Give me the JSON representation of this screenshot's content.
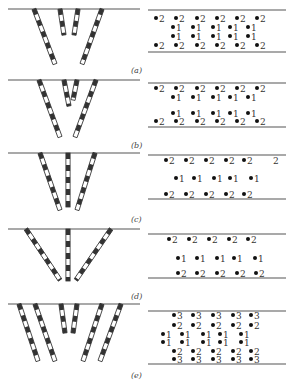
{
  "figure": {
    "panels": [
      {
        "id": "a",
        "caption": "(a)",
        "side_view": {
          "ground_y": 9,
          "bars": [
            {
              "x1": 34,
              "y1": 9,
              "x2": 55,
              "y2": 64
            },
            {
              "x1": 60,
              "y1": 9,
              "x2": 64,
              "y2": 35
            },
            {
              "x1": 78,
              "y1": 9,
              "x2": 74,
              "y2": 35
            },
            {
              "x1": 102,
              "y1": 9,
              "x2": 82,
              "y2": 64
            }
          ]
        },
        "plan_view": {
          "top_line_y": 10,
          "bottom_line_y": 52,
          "rows": [
            {
              "y": 18,
              "holes": [
                {
                  "x": 156,
                  "n": "2"
                },
                {
                  "x": 176,
                  "n": "2"
                },
                {
                  "x": 197,
                  "n": "2"
                },
                {
                  "x": 217,
                  "n": "2"
                },
                {
                  "x": 237,
                  "n": "2"
                },
                {
                  "x": 257,
                  "n": "2"
                }
              ]
            },
            {
              "y": 27,
              "holes": [
                {
                  "x": 173,
                  "n": "1"
                },
                {
                  "x": 193,
                  "n": "1"
                },
                {
                  "x": 213,
                  "n": "1"
                },
                {
                  "x": 230,
                  "n": "1"
                },
                {
                  "x": 248,
                  "n": "1"
                }
              ]
            },
            {
              "y": 36,
              "holes": [
                {
                  "x": 173,
                  "n": "1"
                },
                {
                  "x": 193,
                  "n": "1"
                },
                {
                  "x": 213,
                  "n": "1"
                },
                {
                  "x": 230,
                  "n": "1"
                },
                {
                  "x": 248,
                  "n": "1"
                }
              ]
            },
            {
              "y": 45,
              "holes": [
                {
                  "x": 156,
                  "n": "2"
                },
                {
                  "x": 176,
                  "n": "2"
                },
                {
                  "x": 197,
                  "n": "2"
                },
                {
                  "x": 217,
                  "n": "2"
                },
                {
                  "x": 237,
                  "n": "2"
                },
                {
                  "x": 257,
                  "n": "2"
                }
              ]
            }
          ]
        },
        "caption_pos": {
          "x": 131,
          "y": 66
        }
      },
      {
        "id": "b",
        "caption": "(b)",
        "side_view": {
          "ground_y": 80,
          "bars": [
            {
              "x1": 39,
              "y1": 80,
              "x2": 60,
              "y2": 137
            },
            {
              "x1": 64,
              "y1": 80,
              "x2": 69,
              "y2": 106
            },
            {
              "x1": 77,
              "y1": 80,
              "x2": 73,
              "y2": 100
            },
            {
              "x1": 96,
              "y1": 80,
              "x2": 75,
              "y2": 137
            }
          ]
        },
        "plan_view": {
          "top_line_y": 83,
          "bottom_line_y": 127,
          "rows": [
            {
              "y": 88,
              "holes": [
                {
                  "x": 156,
                  "n": "2"
                },
                {
                  "x": 176,
                  "n": "2"
                },
                {
                  "x": 197,
                  "n": "2"
                },
                {
                  "x": 217,
                  "n": "2"
                },
                {
                  "x": 237,
                  "n": "2"
                },
                {
                  "x": 257,
                  "n": "2"
                }
              ]
            },
            {
              "y": 97,
              "holes": [
                {
                  "x": 173,
                  "n": "1"
                },
                {
                  "x": 193,
                  "n": "1"
                },
                {
                  "x": 213,
                  "n": "1"
                },
                {
                  "x": 230,
                  "n": "1"
                },
                {
                  "x": 248,
                  "n": "1"
                }
              ]
            },
            {
              "y": 113,
              "holes": [
                {
                  "x": 173,
                  "n": "1"
                },
                {
                  "x": 193,
                  "n": "1"
                },
                {
                  "x": 213,
                  "n": "1"
                },
                {
                  "x": 230,
                  "n": "1"
                },
                {
                  "x": 248,
                  "n": "1"
                }
              ]
            },
            {
              "y": 121,
              "holes": [
                {
                  "x": 156,
                  "n": "2"
                },
                {
                  "x": 176,
                  "n": "2"
                },
                {
                  "x": 197,
                  "n": "2"
                },
                {
                  "x": 217,
                  "n": "2"
                },
                {
                  "x": 237,
                  "n": "2"
                },
                {
                  "x": 257,
                  "n": "2"
                }
              ]
            }
          ]
        },
        "caption_pos": {
          "x": 131,
          "y": 141
        }
      },
      {
        "id": "c",
        "caption": "(c)",
        "side_view": {
          "ground_y": 153,
          "bars": [
            {
              "x1": 40,
              "y1": 153,
              "x2": 60,
              "y2": 210
            },
            {
              "x1": 68,
              "y1": 153,
              "x2": 68,
              "y2": 207
            },
            {
              "x1": 95,
              "y1": 153,
              "x2": 77,
              "y2": 210
            }
          ]
        },
        "plan_view": {
          "top_line_y": 155,
          "bottom_line_y": 199,
          "rows": [
            {
              "y": 160,
              "holes": [
                {
                  "x": 166,
                  "n": "2"
                },
                {
                  "x": 186,
                  "n": "2"
                },
                {
                  "x": 206,
                  "n": "2"
                },
                {
                  "x": 226,
                  "n": "2"
                },
                {
                  "x": 244,
                  "n": "2"
                },
                {
                  "x": 270,
                  "n": "2",
                  "no_dot": true
                }
              ]
            },
            {
              "y": 178,
              "holes": [
                {
                  "x": 176,
                  "n": "1"
                },
                {
                  "x": 194,
                  "n": "1"
                },
                {
                  "x": 214,
                  "n": "1"
                },
                {
                  "x": 230,
                  "n": "1"
                },
                {
                  "x": 251,
                  "n": "1"
                }
              ]
            },
            {
              "y": 194,
              "holes": [
                {
                  "x": 166,
                  "n": "2"
                },
                {
                  "x": 186,
                  "n": "2"
                },
                {
                  "x": 206,
                  "n": "2"
                },
                {
                  "x": 226,
                  "n": "2"
                },
                {
                  "x": 244,
                  "n": "2"
                }
              ]
            }
          ]
        },
        "caption_pos": {
          "x": 131,
          "y": 215
        }
      },
      {
        "id": "d",
        "caption": "(d)",
        "side_view": {
          "ground_y": 229,
          "bars": [
            {
              "x1": 26,
              "y1": 229,
              "x2": 60,
              "y2": 280
            },
            {
              "x1": 68,
              "y1": 229,
              "x2": 68,
              "y2": 281
            },
            {
              "x1": 111,
              "y1": 229,
              "x2": 76,
              "y2": 280
            }
          ]
        },
        "plan_view": {
          "top_line_y": 234,
          "bottom_line_y": 278,
          "rows": [
            {
              "y": 239,
              "holes": [
                {
                  "x": 169,
                  "n": "2"
                },
                {
                  "x": 189,
                  "n": "2"
                },
                {
                  "x": 209,
                  "n": "2"
                },
                {
                  "x": 229,
                  "n": "2"
                },
                {
                  "x": 248,
                  "n": "2"
                }
              ]
            },
            {
              "y": 258,
              "holes": [
                {
                  "x": 178,
                  "n": "1"
                },
                {
                  "x": 197,
                  "n": "1"
                },
                {
                  "x": 217,
                  "n": "1"
                },
                {
                  "x": 234,
                  "n": "1"
                },
                {
                  "x": 255,
                  "n": "1"
                }
              ]
            },
            {
              "y": 273,
              "holes": [
                {
                  "x": 178,
                  "n": "2"
                },
                {
                  "x": 197,
                  "n": "2"
                },
                {
                  "x": 217,
                  "n": "2"
                },
                {
                  "x": 237,
                  "n": "2"
                },
                {
                  "x": 256,
                  "n": "2"
                }
              ]
            }
          ]
        },
        "caption_pos": {
          "x": 131,
          "y": 292
        }
      },
      {
        "id": "e",
        "caption": "(e)",
        "side_view": {
          "ground_y": 304,
          "bars": [
            {
              "x1": 19,
              "y1": 304,
              "x2": 38,
              "y2": 361
            },
            {
              "x1": 35,
              "y1": 304,
              "x2": 55,
              "y2": 361
            },
            {
              "x1": 61,
              "y1": 304,
              "x2": 65,
              "y2": 333
            },
            {
              "x1": 77,
              "y1": 304,
              "x2": 73,
              "y2": 333
            },
            {
              "x1": 102,
              "y1": 304,
              "x2": 83,
              "y2": 361
            },
            {
              "x1": 121,
              "y1": 304,
              "x2": 100,
              "y2": 361
            }
          ]
        },
        "plan_view": {
          "top_line_y": 311,
          "bottom_line_y": 364,
          "rows": [
            {
              "y": 315,
              "holes": [
                {
                  "x": 174,
                  "n": "3"
                },
                {
                  "x": 193,
                  "n": "3"
                },
                {
                  "x": 213,
                  "n": "3"
                },
                {
                  "x": 233,
                  "n": "3"
                },
                {
                  "x": 251,
                  "n": "3"
                }
              ]
            },
            {
              "y": 325,
              "holes": [
                {
                  "x": 174,
                  "n": "2"
                },
                {
                  "x": 193,
                  "n": "2"
                },
                {
                  "x": 213,
                  "n": "2"
                },
                {
                  "x": 233,
                  "n": "2"
                },
                {
                  "x": 251,
                  "n": "2"
                }
              ]
            },
            {
              "y": 334,
              "holes": [
                {
                  "x": 163,
                  "n": "1"
                },
                {
                  "x": 182,
                  "n": "1"
                },
                {
                  "x": 203,
                  "n": "1"
                },
                {
                  "x": 220,
                  "n": "1"
                },
                {
                  "x": 241,
                  "n": "1"
                }
              ]
            },
            {
              "y": 342,
              "holes": [
                {
                  "x": 163,
                  "n": "1"
                },
                {
                  "x": 182,
                  "n": "1"
                },
                {
                  "x": 203,
                  "n": "1"
                },
                {
                  "x": 220,
                  "n": "1"
                },
                {
                  "x": 241,
                  "n": "1"
                }
              ]
            },
            {
              "y": 351,
              "holes": [
                {
                  "x": 174,
                  "n": "2"
                },
                {
                  "x": 193,
                  "n": "2"
                },
                {
                  "x": 213,
                  "n": "2"
                },
                {
                  "x": 233,
                  "n": "2"
                },
                {
                  "x": 251,
                  "n": "2"
                }
              ]
            },
            {
              "y": 359,
              "holes": [
                {
                  "x": 174,
                  "n": "3"
                },
                {
                  "x": 193,
                  "n": "3"
                },
                {
                  "x": 213,
                  "n": "3"
                },
                {
                  "x": 233,
                  "n": "3"
                },
                {
                  "x": 251,
                  "n": "3"
                }
              ]
            }
          ]
        },
        "caption_pos": {
          "x": 131,
          "y": 371
        }
      }
    ],
    "left_line": {
      "x1": 8,
      "x2": 140
    },
    "right_line": {
      "x1": 148,
      "x2": 286
    },
    "colors": {
      "line": "#555555",
      "bar_dark": "#333333",
      "bar_light": "#ffffff",
      "dot": "#111111",
      "text": "#333333"
    }
  }
}
